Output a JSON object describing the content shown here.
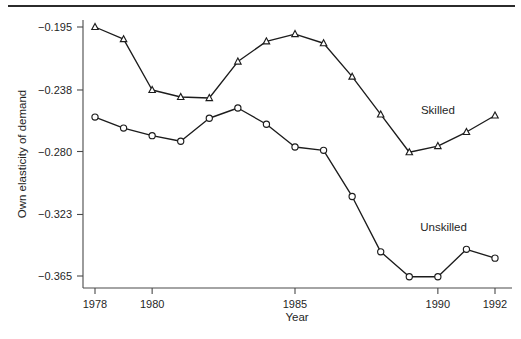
{
  "chart_data": {
    "type": "line",
    "title": "",
    "xlabel": "Year",
    "ylabel": "Own elasticity of demand",
    "x": [
      1978,
      1979,
      1980,
      1981,
      1982,
      1983,
      1984,
      1985,
      1986,
      1987,
      1988,
      1989,
      1990,
      1991,
      1992
    ],
    "xlim": [
      1977.3,
      1992.7
    ],
    "ylim": [
      -0.378,
      -0.188
    ],
    "xticks": [
      1978,
      1980,
      1985,
      1990,
      1992
    ],
    "xtick_labels": [
      "1978",
      "1980",
      "1985",
      "1990",
      "1992"
    ],
    "yticks": [
      -0.195,
      -0.238,
      -0.28,
      -0.323,
      -0.365
    ],
    "ytick_labels": [
      "−0.195",
      "−0.238",
      "−0.280",
      "−0.323",
      "−0.365"
    ],
    "grid": false,
    "legend_position": "inline-annotation",
    "series": [
      {
        "name": "Skilled",
        "marker": "triangle",
        "annotation_x": 1990.0,
        "annotation_y": -0.2545,
        "values": [
          -0.195,
          -0.2033,
          -0.238,
          -0.2428,
          -0.2435,
          -0.2186,
          -0.2048,
          -0.1998,
          -0.2061,
          -0.2289,
          -0.2547,
          -0.2805,
          -0.2763,
          -0.2667,
          -0.2554
        ]
      },
      {
        "name": "Unskilled",
        "marker": "circle",
        "annotation_x": 1990.2,
        "annotation_y": -0.3346,
        "values": [
          -0.2565,
          -0.264,
          -0.2692,
          -0.273,
          -0.2573,
          -0.2503,
          -0.2614,
          -0.2769,
          -0.2792,
          -0.3107,
          -0.3485,
          -0.3655,
          -0.3655,
          -0.3468,
          -0.3528
        ]
      }
    ],
    "colors": {
      "line": "#1c1c1c",
      "marker_fill": "#ffffff",
      "axis": "#4a4a4a",
      "text": "#1f1f1f",
      "background": "#ffffff"
    }
  }
}
